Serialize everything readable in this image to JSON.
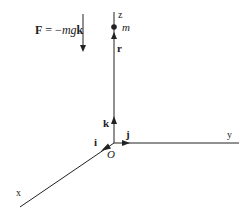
{
  "diagram": {
    "force_equation": {
      "F": "F",
      "equals": " = −",
      "mg": "mg",
      "k": "k"
    },
    "axes": {
      "x_label": "x",
      "y_label": "y",
      "z_label": "z"
    },
    "origin_label": "O",
    "unit_vectors": {
      "i": "i",
      "j": "j",
      "k": "k"
    },
    "position_vector_label": "r",
    "mass_label": "m",
    "colors": {
      "line": "#222222",
      "background": "#ffffff"
    }
  }
}
